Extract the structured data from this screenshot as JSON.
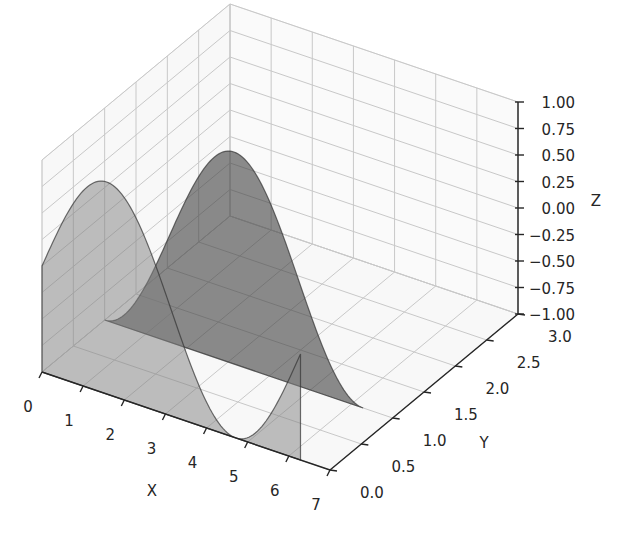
{
  "chart_data": {
    "type": "area",
    "projection": "3d",
    "title": "",
    "xlabel": "X",
    "ylabel": "Y",
    "zlabel": "Z",
    "xlim": [
      0,
      7
    ],
    "ylim": [
      0,
      3
    ],
    "zlim": [
      -1,
      1
    ],
    "xticks": [
      "0",
      "1",
      "2",
      "3",
      "4",
      "5",
      "6",
      "7"
    ],
    "yticks": [
      "0.0",
      "0.5",
      "1.0",
      "1.5",
      "2.0",
      "2.5",
      "3.0"
    ],
    "zticks": [
      "−1.00",
      "−0.75",
      "−0.50",
      "−0.25",
      "0.00",
      "0.25",
      "0.50",
      "0.75",
      "1.00"
    ],
    "grid": true,
    "series": [
      {
        "name": "sin(x) at y=0",
        "function": "sin",
        "y": 0,
        "x_range": [
          0,
          6.283
        ],
        "fill_to": -1,
        "color": "#808080",
        "alpha": 0.5
      },
      {
        "name": "-cos(x) at y=1",
        "function": "-cos",
        "y": 1,
        "x_range": [
          0,
          6.283
        ],
        "fill_to": -1,
        "color": "#404040",
        "alpha": 0.6
      }
    ]
  }
}
